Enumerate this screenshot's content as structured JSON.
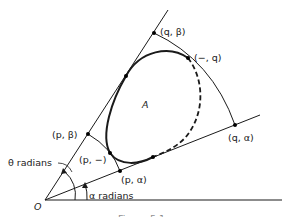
{
  "figure": {
    "region_label": "A",
    "origin_label": "O",
    "points": {
      "q_beta": "(q, β)",
      "dash_q": "(−, q)",
      "q_alpha": "(q, α)",
      "p_beta": "(p, β)",
      "p_dash": "(p, −)",
      "p_alpha": "(p, α)"
    },
    "angles": {
      "theta": "θ radians",
      "alpha": "α radians"
    },
    "caption_partial": "Figure 5.1",
    "colors": {
      "ink": "#1a1a1a",
      "background": "#ffffff"
    }
  }
}
